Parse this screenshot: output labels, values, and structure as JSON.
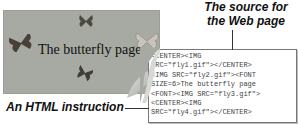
{
  "webpage": {
    "title": "The butterfly page",
    "background_color": "#a6aaa2",
    "images": [
      "fly1.gif",
      "fly2.gif",
      "fly3.gif",
      "fly4.gif"
    ]
  },
  "source": {
    "lines": [
      "<CENTER><IMG",
      "SRC=\"fly1.gif\"></CENTER>",
      "<IMG SRC=\"fly2.gif\"><FONT",
      "SIZE=6>The butterfly page",
      "<FONT><IMG SRC=\"fly3.gif\">",
      "<CENTER><IMG",
      "SRC=\"fly4.gif\"></CENTER>"
    ]
  },
  "captions": {
    "source_line1": "The source for",
    "source_line2": "the Web page",
    "instruction": "An HTML instruction"
  }
}
